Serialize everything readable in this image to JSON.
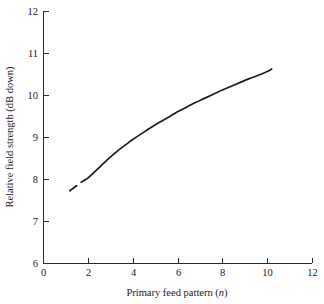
{
  "chart_data": {
    "type": "line",
    "title": "",
    "xlabel": "Primary feed pattern (n)",
    "xlabel_main": "Primary feed pattern (",
    "xlabel_symbol": "n",
    "xlabel_close": ")",
    "ylabel": "Relative field strength (dB down)",
    "xlim": [
      0,
      12
    ],
    "ylim": [
      6,
      12
    ],
    "grid": false,
    "legend": false,
    "xticks": [
      0,
      2,
      4,
      6,
      8,
      10,
      12
    ],
    "xtick_labels": [
      "0",
      "2",
      "4",
      "6",
      "8",
      "10",
      "12"
    ],
    "yticks": [
      6,
      7,
      8,
      9,
      10,
      11,
      12
    ],
    "ytick_labels": [
      "6",
      "7",
      "8",
      "9",
      "10",
      "11",
      "12"
    ],
    "series": [
      {
        "name": "relative field strength",
        "x": [
          1.2,
          1.35,
          1.5,
          1.7,
          1.9,
          2.0,
          2.3,
          2.6,
          3.0,
          3.4,
          3.8,
          4.0,
          4.4,
          4.8,
          5.2,
          5.6,
          6.0,
          6.4,
          6.8,
          7.2,
          7.6,
          8.0,
          8.4,
          8.8,
          9.2,
          9.6,
          10.0,
          10.2
        ],
        "y": [
          7.72,
          7.78,
          7.84,
          7.92,
          7.99,
          8.02,
          8.17,
          8.32,
          8.52,
          8.7,
          8.86,
          8.94,
          9.08,
          9.22,
          9.35,
          9.47,
          9.6,
          9.71,
          9.82,
          9.92,
          10.02,
          10.12,
          10.21,
          10.3,
          10.39,
          10.47,
          10.56,
          10.62
        ],
        "gap_after_x": 1.5,
        "gap_resume_x": 1.7
      }
    ],
    "axis_geometry": {
      "left_px": 43,
      "right_px": 312,
      "top_px": 11,
      "bottom_px": 263
    }
  }
}
